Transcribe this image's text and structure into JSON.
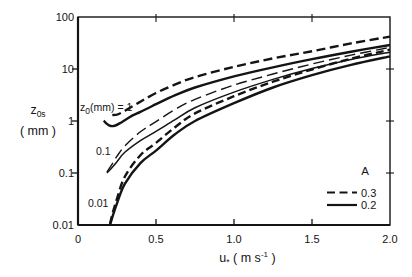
{
  "figure": {
    "background": "#ffffff",
    "ink_color": "#141414"
  },
  "chart_data": {
    "type": "line",
    "title": "",
    "y_scale": "log",
    "grid": false,
    "xlim": [
      0,
      2.0
    ],
    "ylim": [
      0.01,
      100
    ],
    "xlabel": {
      "base": "u",
      "sub": "*",
      "unit_prefix": "( m s",
      "unit_sup": "-1",
      "unit_suffix": " )"
    },
    "ylabel": {
      "base": "z",
      "sub": "0s",
      "unit": "( mm )"
    },
    "x_ticks": [
      {
        "label": "0",
        "value": 0
      },
      {
        "label": "0.5",
        "value": 0.5
      },
      {
        "label": "1.0",
        "value": 1.0
      },
      {
        "label": "1.5",
        "value": 1.5
      },
      {
        "label": "2.0",
        "value": 2.0
      }
    ],
    "y_ticks": [
      {
        "label": "100",
        "value": 100
      },
      {
        "label": "10",
        "value": 10
      },
      {
        "label": "1",
        "value": 1
      },
      {
        "label": "0.1",
        "value": 0.1
      },
      {
        "label": "0.01",
        "value": 0.01
      }
    ],
    "series": [
      {
        "name": "z0=1mm A=0.3",
        "z0_mm": 1,
        "A": 0.3,
        "line_style": "dashed",
        "thickness": 2.4,
        "dash": "9 4.5",
        "points": [
          [
            0.22,
            1.3
          ],
          [
            0.25,
            1.33
          ],
          [
            0.28,
            1.45
          ],
          [
            0.32,
            1.7
          ],
          [
            0.4,
            2.35
          ],
          [
            0.5,
            3.45
          ],
          [
            0.62,
            5.0
          ],
          [
            0.75,
            7.0
          ],
          [
            1.0,
            11.0
          ],
          [
            1.25,
            16.0
          ],
          [
            1.5,
            22.0
          ],
          [
            1.75,
            31.0
          ],
          [
            2.0,
            42.0
          ]
        ]
      },
      {
        "name": "z0=1mm A=0.2",
        "z0_mm": 1,
        "A": 0.2,
        "line_style": "solid",
        "thickness": 2.4,
        "dash": null,
        "points": [
          [
            0.165,
            1.02
          ],
          [
            0.185,
            0.88
          ],
          [
            0.21,
            0.8
          ],
          [
            0.24,
            0.82
          ],
          [
            0.28,
            0.95
          ],
          [
            0.35,
            1.28
          ],
          [
            0.4,
            1.5
          ],
          [
            0.5,
            2.1
          ],
          [
            0.62,
            3.1
          ],
          [
            0.75,
            4.4
          ],
          [
            1.0,
            7.2
          ],
          [
            1.25,
            10.8
          ],
          [
            1.5,
            15.5
          ],
          [
            1.75,
            21.5
          ],
          [
            2.0,
            29.0
          ]
        ]
      },
      {
        "name": "z0=0.1mm A=0.3",
        "z0_mm": 0.1,
        "A": 0.3,
        "line_style": "dashed",
        "thickness": 1.4,
        "dash": "11 5",
        "points": [
          [
            0.185,
            0.105
          ],
          [
            0.21,
            0.135
          ],
          [
            0.25,
            0.21
          ],
          [
            0.3,
            0.33
          ],
          [
            0.4,
            0.62
          ],
          [
            0.5,
            0.97
          ],
          [
            0.62,
            1.65
          ],
          [
            0.75,
            2.6
          ],
          [
            1.0,
            4.9
          ],
          [
            1.25,
            8.0
          ],
          [
            1.5,
            12.5
          ],
          [
            1.75,
            18.5
          ],
          [
            2.0,
            26.0
          ]
        ]
      },
      {
        "name": "z0=0.1mm A=0.2",
        "z0_mm": 0.1,
        "A": 0.2,
        "line_style": "solid",
        "thickness": 1.5,
        "dash": null,
        "points": [
          [
            0.185,
            0.1
          ],
          [
            0.21,
            0.12
          ],
          [
            0.25,
            0.165
          ],
          [
            0.3,
            0.25
          ],
          [
            0.4,
            0.42
          ],
          [
            0.5,
            0.63
          ],
          [
            0.62,
            1.05
          ],
          [
            0.75,
            1.8
          ],
          [
            1.0,
            3.6
          ],
          [
            1.25,
            6.3
          ],
          [
            1.5,
            10.2
          ],
          [
            1.75,
            15.3
          ],
          [
            2.0,
            21.0
          ]
        ]
      },
      {
        "name": "z0=0.01mm A=0.3",
        "z0_mm": 0.01,
        "A": 0.3,
        "line_style": "dashed",
        "thickness": 2.4,
        "dash": "8 4",
        "points": [
          [
            0.205,
            0.0105
          ],
          [
            0.22,
            0.016
          ],
          [
            0.25,
            0.032
          ],
          [
            0.3,
            0.085
          ],
          [
            0.4,
            0.22
          ],
          [
            0.5,
            0.38
          ],
          [
            0.62,
            0.75
          ],
          [
            0.75,
            1.4
          ],
          [
            1.0,
            3.0
          ],
          [
            1.25,
            5.7
          ],
          [
            1.5,
            9.8
          ],
          [
            1.75,
            15.8
          ],
          [
            2.0,
            23.5
          ]
        ]
      },
      {
        "name": "z0=0.01mm A=0.2",
        "z0_mm": 0.01,
        "A": 0.2,
        "line_style": "solid",
        "thickness": 2.4,
        "dash": null,
        "points": [
          [
            0.205,
            0.01
          ],
          [
            0.22,
            0.014
          ],
          [
            0.25,
            0.026
          ],
          [
            0.3,
            0.062
          ],
          [
            0.4,
            0.155
          ],
          [
            0.5,
            0.27
          ],
          [
            0.62,
            0.55
          ],
          [
            0.75,
            1.0
          ],
          [
            1.0,
            2.2
          ],
          [
            1.25,
            4.4
          ],
          [
            1.5,
            7.6
          ],
          [
            1.75,
            12.0
          ],
          [
            2.0,
            17.5
          ]
        ]
      }
    ],
    "annotations": [
      {
        "base": "z",
        "sub": "0",
        "rest": "(mm) = 1",
        "x": 80,
        "y": 101
      },
      {
        "text": "0.1",
        "x": 96,
        "y": 145
      },
      {
        "text": "0.01",
        "x": 88,
        "y": 197
      }
    ],
    "legend": {
      "title": "A",
      "position": "lower right",
      "items": [
        {
          "label": "0.3",
          "line_style": "dashed"
        },
        {
          "label": "0.2",
          "line_style": "solid"
        }
      ]
    }
  }
}
